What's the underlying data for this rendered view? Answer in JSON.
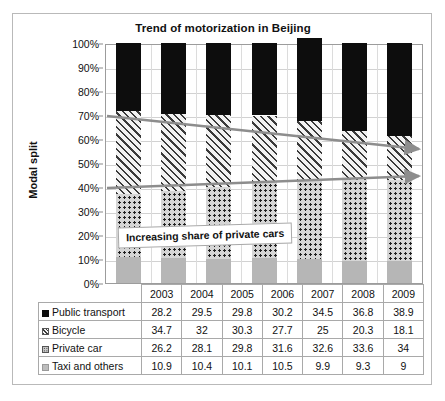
{
  "figure": {
    "title": "Trend of motorization in Beijing",
    "y_axis_title": "Modal split",
    "annotation": "Increasing share of private cars"
  },
  "chart_data": {
    "type": "bar",
    "stacked": true,
    "title": "Trend of motorization in Beijing",
    "xlabel": "",
    "ylabel": "Modal split",
    "categories": [
      "2003",
      "2004",
      "2005",
      "2006",
      "2007",
      "2008",
      "2009"
    ],
    "ylim": [
      0,
      100
    ],
    "ytick_labels": [
      "0%",
      "10%",
      "20%",
      "30%",
      "40%",
      "50%",
      "60%",
      "70%",
      "80%",
      "90%",
      "100%"
    ],
    "ytick_values": [
      0,
      10,
      20,
      30,
      40,
      50,
      60,
      70,
      80,
      90,
      100
    ],
    "grid": true,
    "legend_position": "table-row-headers",
    "stack_order_bottom_to_top": [
      "Taxi and others",
      "Private car",
      "Bicycle",
      "Public transport"
    ],
    "series": [
      {
        "name": "Public transport",
        "swatch": "solid-black",
        "color": "#0d0d0d",
        "values": [
          28.2,
          29.5,
          29.8,
          30.2,
          34.5,
          36.8,
          38.9
        ]
      },
      {
        "name": "Bicycle",
        "swatch": "diagonal-hatch",
        "color": "#f2f2f2",
        "values": [
          34.7,
          32,
          30.3,
          27.7,
          25,
          20.3,
          18.1
        ]
      },
      {
        "name": "Private car",
        "swatch": "dotted",
        "color": "#d5d5d5",
        "values": [
          26.2,
          28.1,
          29.8,
          31.6,
          32.6,
          33.6,
          34
        ]
      },
      {
        "name": "Taxi and others",
        "swatch": "solid-gray",
        "color": "#b6b6b6",
        "values": [
          10.9,
          10.4,
          10.1,
          10.5,
          9.9,
          9.3,
          9
        ]
      }
    ],
    "annotations": [
      {
        "text": "Increasing share of private cars",
        "type": "text-box"
      },
      {
        "type": "arrow",
        "label": "bicycle-decline-arrow",
        "from_percent": 70,
        "to_percent": 57
      },
      {
        "type": "arrow",
        "label": "private-car-growth-arrow",
        "from_percent": 40,
        "to_percent": 45
      }
    ]
  },
  "table": {
    "year_header": [
      "2003",
      "2004",
      "2005",
      "2006",
      "2007",
      "2008",
      "2009"
    ],
    "rows": [
      {
        "label": "Public transport",
        "values": [
          "28.2",
          "29.5",
          "29.8",
          "30.2",
          "34.5",
          "36.8",
          "38.9"
        ]
      },
      {
        "label": "Bicycle",
        "values": [
          "34.7",
          "32",
          "30.3",
          "27.7",
          "25",
          "20.3",
          "18.1"
        ]
      },
      {
        "label": "Private car",
        "values": [
          "26.2",
          "28.1",
          "29.8",
          "31.6",
          "32.6",
          "33.6",
          "34"
        ]
      },
      {
        "label": "Taxi and others",
        "values": [
          "10.9",
          "10.4",
          "10.1",
          "10.5",
          "9.9",
          "9.3",
          "9"
        ]
      }
    ]
  }
}
